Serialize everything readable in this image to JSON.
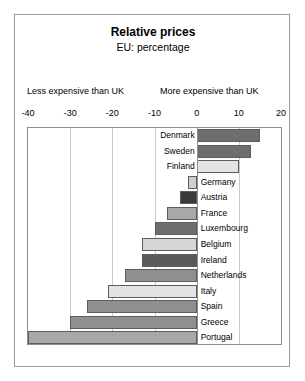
{
  "header": {
    "title": "Relative prices",
    "subtitle": "EU: percentage"
  },
  "annotations": {
    "left": "Less expensive than UK",
    "right": "More expensive than UK"
  },
  "chart_data": {
    "type": "bar",
    "orientation": "horizontal",
    "title": "Relative prices",
    "subtitle": "EU: percentage",
    "xlabel": "",
    "ylabel": "",
    "xlim": [
      -40,
      20
    ],
    "xticks": [
      -40,
      -30,
      -20,
      -10,
      0,
      10,
      20
    ],
    "tick_labels": [
      "-40",
      "-30",
      "-20",
      "-10",
      "0",
      "10",
      "20"
    ],
    "grid": true,
    "legend": false,
    "zero_reference": 0,
    "annotations": [
      "Less expensive than UK",
      "More expensive than UK"
    ],
    "categories": [
      "Denmark",
      "Sweden",
      "Finland",
      "Germany",
      "Austria",
      "France",
      "Luxembourg",
      "Belgium",
      "Ireland",
      "Netherlands",
      "Italy",
      "Spain",
      "Greece",
      "Portugal"
    ],
    "values": [
      15,
      13,
      10,
      -2,
      -4,
      -7,
      -10,
      -13,
      -13,
      -17,
      -21,
      -26,
      -30,
      -40
    ],
    "colors": [
      "#6e6e6e",
      "#6e6e6e",
      "#e3e3e3",
      "#cfcfcf",
      "#3a3a3a",
      "#a8a8a8",
      "#6e6e6e",
      "#d6d6d6",
      "#5a5a5a",
      "#8f8f8f",
      "#e3e3e3",
      "#8f8f8f",
      "#8f8f8f",
      "#a8a8a8"
    ]
  }
}
